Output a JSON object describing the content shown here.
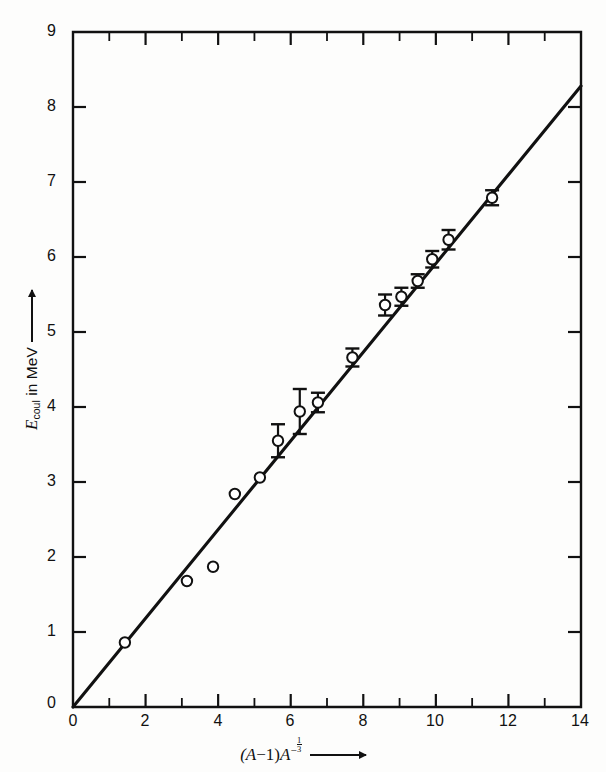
{
  "figure": {
    "background_color": "#fdfdfc",
    "ink_color": "#111111"
  },
  "axes": {
    "x_label_prefix": "(A",
    "x_label_minus": "−",
    "x_label_one": "1)",
    "x_label_A": "A",
    "x_label_exponent_sign": "−",
    "x_label_exponent_num": "1",
    "x_label_exponent_den": "3",
    "x_label_plain": "(A−1)A^(−1/3) →",
    "y_label_symbol": "E",
    "y_label_subscript": "coul",
    "y_label_rest": " in MeV",
    "y_label_plain": "E_coul in MeV →",
    "x_ticks": [
      "0",
      "2",
      "4",
      "6",
      "8",
      "10",
      "12",
      "14"
    ],
    "x_tick_values": [
      0,
      2,
      4,
      6,
      8,
      10,
      12,
      14
    ],
    "x_minor_tick_values": [
      1,
      3,
      5,
      7,
      9,
      11,
      13
    ],
    "y_ticks": [
      "0",
      "1",
      "2",
      "3",
      "4",
      "5",
      "6",
      "7",
      "8",
      "9"
    ],
    "y_tick_values": [
      0,
      1,
      2,
      3,
      4,
      5,
      6,
      7,
      8,
      9
    ],
    "xlim": [
      0,
      14
    ],
    "ylim": [
      0,
      9
    ],
    "origin_label": "0"
  },
  "chart_data": {
    "type": "scatter",
    "title": "",
    "subtitle": "",
    "xlabel": "(A−1)A^(−1/3)",
    "ylabel": "E_coul in MeV",
    "xlim": [
      0,
      14
    ],
    "ylim": [
      0,
      9
    ],
    "grid": false,
    "legend": false,
    "legend_position": "none",
    "marker_style": "open-circle",
    "series": [
      {
        "name": "Measured Coulomb energies",
        "type": "scatter",
        "marker": "open-circle",
        "points": [
          {
            "x": 1.43,
            "y": 0.86,
            "yerr": 0.0
          },
          {
            "x": 3.14,
            "y": 1.68,
            "yerr": 0.0
          },
          {
            "x": 3.86,
            "y": 1.87,
            "yerr": 0.0
          },
          {
            "x": 4.46,
            "y": 2.84,
            "yerr": 0.0
          },
          {
            "x": 5.15,
            "y": 3.06,
            "yerr": 0.0
          },
          {
            "x": 5.65,
            "y": 3.55,
            "yerr": 0.22
          },
          {
            "x": 6.25,
            "y": 3.94,
            "yerr": 0.3
          },
          {
            "x": 6.75,
            "y": 4.06,
            "yerr": 0.13
          },
          {
            "x": 7.7,
            "y": 4.66,
            "yerr": 0.12
          },
          {
            "x": 8.6,
            "y": 5.36,
            "yerr": 0.14
          },
          {
            "x": 9.05,
            "y": 5.47,
            "yerr": 0.12
          },
          {
            "x": 9.5,
            "y": 5.68,
            "yerr": 0.09
          },
          {
            "x": 9.9,
            "y": 5.97,
            "yerr": 0.11
          },
          {
            "x": 10.35,
            "y": 6.23,
            "yerr": 0.13
          },
          {
            "x": 11.55,
            "y": 6.79,
            "yerr": 0.1
          }
        ]
      },
      {
        "name": "Least-squares fit line",
        "type": "line",
        "x": [
          0,
          14
        ],
        "y": [
          0,
          8.28
        ],
        "slope": 0.5914,
        "intercept": 0
      }
    ]
  }
}
